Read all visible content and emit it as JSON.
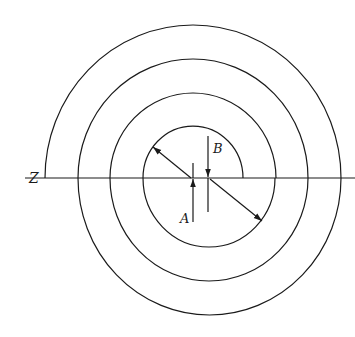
{
  "diagram": {
    "type": "concentric semicircles offset about two centers",
    "stroke_color": "#1a1a1a",
    "background": "#ffffff",
    "axis": {
      "label": "Z",
      "y": 178,
      "x_start": 25,
      "x_end": 355
    },
    "upper_semicircles": {
      "center_label": "A",
      "center": [
        193,
        178
      ],
      "rx": [
        50,
        83,
        115,
        148
      ],
      "ry": [
        52,
        85,
        119,
        153
      ]
    },
    "lower_semicircles": {
      "center_label": "B",
      "center": [
        209,
        178
      ],
      "rx": [
        66,
        99,
        131.5
      ],
      "ry": [
        69,
        103,
        137
      ]
    },
    "labels": {
      "z": "Z",
      "a": "A",
      "b": "B"
    },
    "arrows": [
      {
        "name": "radius-arrow-upper",
        "from": [
          191,
          178
        ],
        "to": [
          153,
          147
        ]
      },
      {
        "name": "radius-arrow-lower",
        "from": [
          210,
          179
        ],
        "to": [
          262,
          221
        ]
      },
      {
        "name": "center-marker-a",
        "from": [
          193,
          222
        ],
        "to": [
          193,
          179
        ],
        "line_top": 163
      },
      {
        "name": "center-marker-b",
        "from": [
          208,
          136
        ],
        "to": [
          208,
          177
        ],
        "line_bottom": 212
      }
    ]
  }
}
